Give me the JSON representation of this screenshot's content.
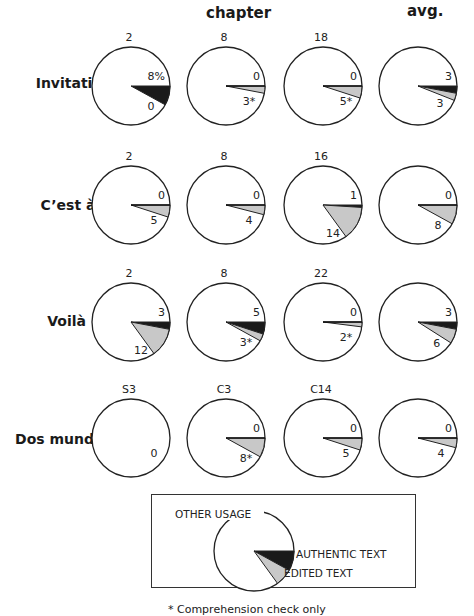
{
  "chart_data": {
    "type": "pie",
    "title": "",
    "column_headers": [
      "chapter",
      "avg."
    ],
    "columns": [
      "chapter A",
      "chapter B",
      "chapter C",
      "avg."
    ],
    "legend": [
      {
        "name": "OTHER USAGE",
        "color": "#ffffff"
      },
      {
        "name": "AUTHENTIC TEXT",
        "color": "#1a1a1a"
      },
      {
        "name": "EDITED TEXT",
        "color": "#c8c8c8"
      }
    ],
    "rows": [
      {
        "label": "Invitation",
        "dagger": false,
        "pies": [
          {
            "title": "2",
            "authentic": 8,
            "edited": 0,
            "authentic_label": "8%",
            "edited_label": "0"
          },
          {
            "title": "8",
            "authentic": 0,
            "edited": 3,
            "authentic_label": "0",
            "edited_label": "3*"
          },
          {
            "title": "18",
            "authentic": 0,
            "edited": 5,
            "authentic_label": "0",
            "edited_label": "5*"
          },
          {
            "title": "",
            "authentic": 3,
            "edited": 3,
            "authentic_label": "3",
            "edited_label": "3"
          }
        ]
      },
      {
        "label": "C’est à dire",
        "dagger": true,
        "pies": [
          {
            "title": "2",
            "authentic": 0,
            "edited": 5,
            "authentic_label": "0",
            "edited_label": "5"
          },
          {
            "title": "8",
            "authentic": 0,
            "edited": 4,
            "authentic_label": "0",
            "edited_label": "4"
          },
          {
            "title": "16",
            "authentic": 1,
            "edited": 14,
            "authentic_label": "1",
            "edited_label": "14"
          },
          {
            "title": "",
            "authentic": 0,
            "edited": 8,
            "authentic_label": "0",
            "edited_label": "8"
          }
        ]
      },
      {
        "label": "Voilà",
        "dagger": false,
        "pies": [
          {
            "title": "2",
            "authentic": 3,
            "edited": 12,
            "authentic_label": "3",
            "edited_label": "12"
          },
          {
            "title": "8",
            "authentic": 5,
            "edited": 3,
            "authentic_label": "5",
            "edited_label": "3*"
          },
          {
            "title": "22",
            "authentic": 0,
            "edited": 2,
            "authentic_label": "0",
            "edited_label": "2*"
          },
          {
            "title": "",
            "authentic": 3,
            "edited": 6,
            "authentic_label": "3",
            "edited_label": "6"
          }
        ]
      },
      {
        "label": "Dos mundos",
        "dagger": false,
        "pies": [
          {
            "title": "S3",
            "authentic": 0,
            "edited": 0,
            "authentic_label": "",
            "edited_label": "0"
          },
          {
            "title": "C3",
            "authentic": 0,
            "edited": 8,
            "authentic_label": "0",
            "edited_label": "8*"
          },
          {
            "title": "C14",
            "authentic": 0,
            "edited": 5,
            "authentic_label": "0",
            "edited_label": "5"
          },
          {
            "title": "",
            "authentic": 0,
            "edited": 4,
            "authentic_label": "0",
            "edited_label": "4"
          }
        ]
      }
    ],
    "units": "percent of exercises",
    "footnote": "* Comprehension check only"
  },
  "header": {
    "chapter": "chapter",
    "avg": "avg."
  },
  "dagger_symbol": "†",
  "legend_labels": {
    "other": "OTHER USAGE",
    "authentic": "AUTHENTIC TEXT",
    "edited": "EDITED TEXT"
  },
  "legend_sample": {
    "authentic": 8,
    "edited": 7
  },
  "colors": {
    "authentic": "#1a1a1a",
    "edited": "#c8c8c8",
    "other": "#ffffff",
    "stroke": "#222222"
  },
  "footnote": "* Comprehension check only"
}
